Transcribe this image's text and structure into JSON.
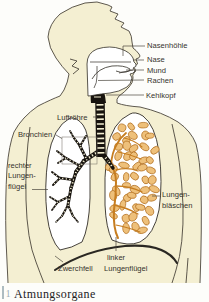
{
  "figure": {
    "labels": {
      "nasenhoehle": "Nasenhöhle",
      "nase": "Nase",
      "mund": "Mund",
      "rachen": "Rachen",
      "kehlkopf": "Kehlkopf",
      "luftroehre": "Luftröhre",
      "bronchien": "Bronchien",
      "rechter_lungenfluegel_lines": [
        "rechter",
        "Lungen-",
        "flügel"
      ],
      "lungenblaeschen_lines": [
        "Lungen-",
        "bläschen"
      ],
      "zwerchfell": "Zwerchfell",
      "linker_lungenfluegel_lines": [
        "linker",
        "Lungenflügel"
      ]
    },
    "caption": {
      "number": "1",
      "text": "Atmungsorgane"
    },
    "colors": {
      "body_fill": "#f4efd2",
      "body_outline": "#4c463c",
      "section_outline": "#312d26",
      "airway_black": "#17130e",
      "alveoli_fill": "#eec07a",
      "alveoli_stroke": "#b06c1c",
      "branch_orange": "#c67d20",
      "label_text": "#35322c",
      "caption_accent": "#9aacb4",
      "caption_text": "#24221e"
    }
  }
}
